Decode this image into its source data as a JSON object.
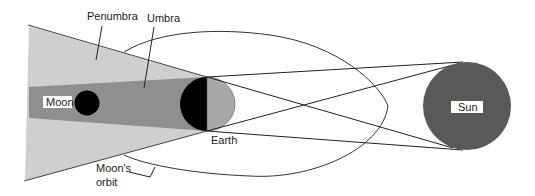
{
  "diagram": {
    "type": "lunar-eclipse",
    "labels": {
      "penumbra": "Penumbra",
      "umbra": "Umbra",
      "moon": "Moon",
      "earth": "Earth",
      "sun": "Sun",
      "orbit_line1": "Moon's",
      "orbit_line2": "orbit"
    },
    "colors": {
      "penumbra": "#cfcfcf",
      "umbra": "#8f8f8f",
      "moon": "#000000",
      "earth_night": "#000000",
      "earth_day": "#a8a8a8",
      "sun": "#595959",
      "lines": "#222222"
    }
  }
}
